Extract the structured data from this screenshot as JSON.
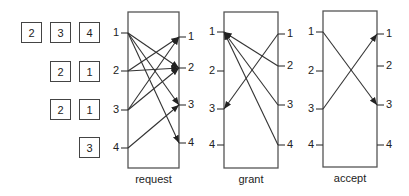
{
  "queues": {
    "rows": [
      {
        "input": 1,
        "cells": [
          "2",
          "3",
          "4"
        ]
      },
      {
        "input": 2,
        "cells": [
          "2",
          "1"
        ]
      },
      {
        "input": 3,
        "cells": [
          "2",
          "1"
        ]
      },
      {
        "input": 4,
        "cells": [
          "3"
        ]
      }
    ]
  },
  "stages": [
    {
      "name": "request",
      "label": "request",
      "box": {
        "x": 128,
        "y": 12,
        "w": 51,
        "h": 156
      },
      "left_ports": [
        {
          "label": "1",
          "y": 33
        },
        {
          "label": "2",
          "y": 71
        },
        {
          "label": "3",
          "y": 110
        },
        {
          "label": "4",
          "y": 148
        }
      ],
      "right_ports": [
        {
          "label": "1",
          "y": 37
        },
        {
          "label": "2",
          "y": 68
        },
        {
          "label": "3",
          "y": 105
        },
        {
          "label": "4",
          "y": 143
        }
      ],
      "direction": "left-to-right",
      "edges": [
        [
          1,
          2
        ],
        [
          1,
          3
        ],
        [
          1,
          4
        ],
        [
          2,
          1
        ],
        [
          2,
          2
        ],
        [
          3,
          1
        ],
        [
          3,
          2
        ],
        [
          4,
          3
        ]
      ]
    },
    {
      "name": "grant",
      "label": "grant",
      "box": {
        "x": 224,
        "y": 12,
        "w": 54,
        "h": 156
      },
      "left_ports": [
        {
          "label": "1",
          "y": 32
        },
        {
          "label": "2",
          "y": 71
        },
        {
          "label": "3",
          "y": 109
        },
        {
          "label": "4",
          "y": 145
        }
      ],
      "right_ports": [
        {
          "label": "1",
          "y": 34
        },
        {
          "label": "2",
          "y": 66
        },
        {
          "label": "3",
          "y": 105
        },
        {
          "label": "4",
          "y": 145
        }
      ],
      "direction": "right-to-left",
      "edges": [
        [
          1,
          3
        ],
        [
          2,
          1
        ],
        [
          3,
          1
        ],
        [
          4,
          1
        ]
      ]
    },
    {
      "name": "accept",
      "label": "accept",
      "box": {
        "x": 323,
        "y": 11,
        "w": 54,
        "h": 156
      },
      "left_ports": [
        {
          "label": "1",
          "y": 32
        },
        {
          "label": "2",
          "y": 71
        },
        {
          "label": "3",
          "y": 109
        },
        {
          "label": "4",
          "y": 145
        }
      ],
      "right_ports": [
        {
          "label": "1",
          "y": 34
        },
        {
          "label": "2",
          "y": 66
        },
        {
          "label": "3",
          "y": 105
        },
        {
          "label": "4",
          "y": 145
        }
      ],
      "direction": "left-to-right",
      "edges": [
        [
          1,
          3
        ],
        [
          3,
          1
        ]
      ]
    }
  ],
  "colors": {
    "line": "#333333",
    "box": "#555555"
  }
}
